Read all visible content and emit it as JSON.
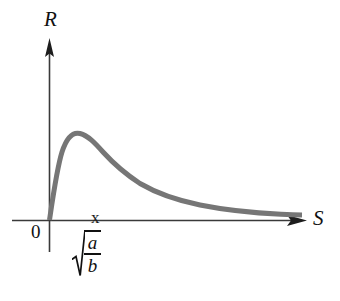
{
  "figure": {
    "background_color": "#ffffff",
    "width": 340,
    "height": 301
  },
  "axes": {
    "y_label": "R",
    "x_label": "S",
    "origin_label": "0",
    "axis_color": "#3a3a3a",
    "arrow_style": "solid-triangle"
  },
  "ticks": {
    "x_tick_mark": "x",
    "x_tick_value_numerator": "a",
    "x_tick_value_denominator": "b",
    "x_tick_value_notation": "sqrt(a/b)",
    "radical_symbol": "radical-icon"
  },
  "chart_data": {
    "type": "line",
    "title": "",
    "xlabel": "S",
    "ylabel": "R",
    "grid": false,
    "legend": null,
    "axis_arrows": true,
    "series": [
      {
        "name": "R(S)",
        "color": "#767676",
        "line_width": 5,
        "x": [
          0,
          0.06,
          0.13,
          0.2,
          0.28,
          0.38,
          0.5,
          0.62,
          0.78,
          0.95,
          1.15,
          1.4,
          1.7,
          2.05,
          2.45,
          2.9,
          3.4,
          3.95,
          4.5,
          5.1,
          5.7,
          6.3,
          6.9,
          7.5,
          8.1,
          8.7,
          9.3,
          10.0
        ],
        "y": [
          0,
          0.32,
          0.58,
          0.76,
          0.9,
          0.985,
          1.0,
          0.985,
          0.945,
          0.9,
          0.845,
          0.785,
          0.72,
          0.655,
          0.595,
          0.54,
          0.49,
          0.445,
          0.408,
          0.375,
          0.348,
          0.325,
          0.307,
          0.291,
          0.278,
          0.266,
          0.256,
          0.245
        ],
        "peak_x": 0.5,
        "peak_y": 1.0,
        "peak_x_label": "sqrt(a/b)",
        "start_at_origin": true,
        "decays_to_zero": true
      }
    ],
    "xlim": [
      0,
      10.3
    ],
    "ylim": [
      0,
      1.12
    ],
    "x_tick_positions": [
      0.5
    ],
    "x_tick_labels": [
      "sqrt(a/b)"
    ],
    "y_tick_positions": [],
    "y_tick_labels": [],
    "annotation": "Resistance R as a function of S peaking at S = sqrt(a/b)"
  }
}
